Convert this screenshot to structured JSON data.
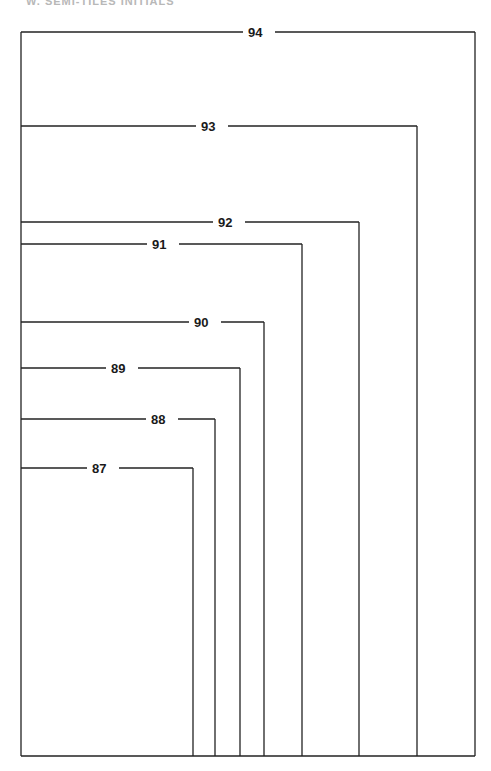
{
  "header": {
    "text": "W. SEMI-TILES INITIALS"
  },
  "diagram": {
    "frame": {
      "left": 21,
      "top": 32,
      "right": 475,
      "bottom": 756
    },
    "stroke_color": "#222222",
    "brackets": [
      {
        "label": "94",
        "y": 32,
        "x_right": 475,
        "label_x": 255
      },
      {
        "label": "93",
        "y": 126,
        "x_right": 417,
        "label_x": 208
      },
      {
        "label": "92",
        "y": 222,
        "x_right": 359,
        "label_x": 225
      },
      {
        "label": "91",
        "y": 244,
        "x_right": 302,
        "label_x": 159
      },
      {
        "label": "90",
        "y": 322,
        "x_right": 264,
        "label_x": 201
      },
      {
        "label": "89",
        "y": 368,
        "x_right": 240,
        "label_x": 118
      },
      {
        "label": "88",
        "y": 419,
        "x_right": 215,
        "label_x": 158
      },
      {
        "label": "87",
        "y": 468,
        "x_right": 193,
        "label_x": 99
      }
    ]
  }
}
